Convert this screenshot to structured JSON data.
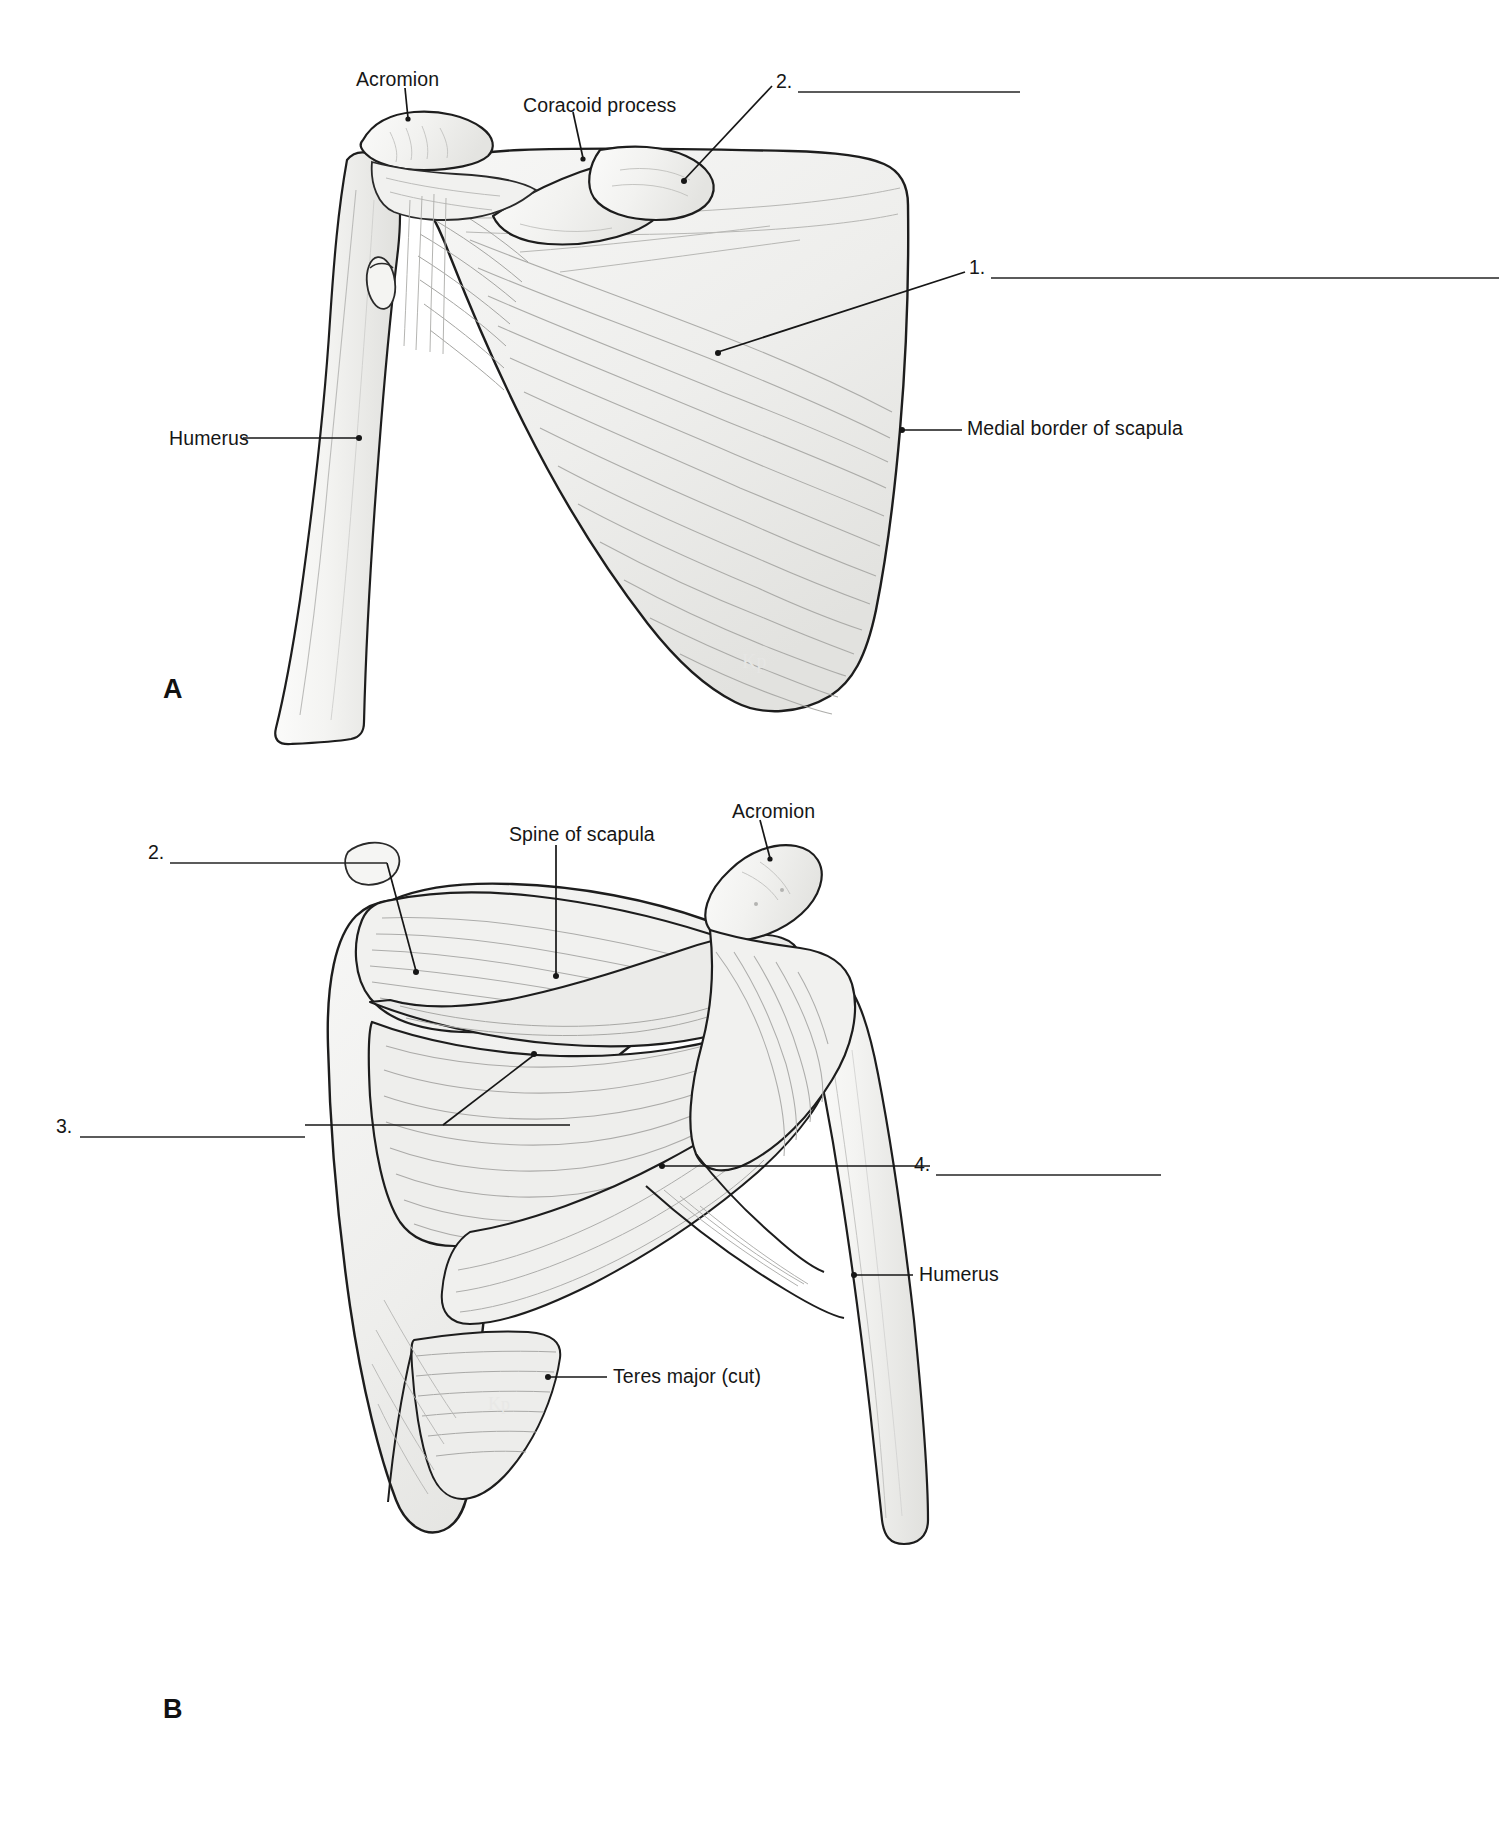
{
  "document": {
    "type": "anatomy-labeling-worksheet",
    "subject": "Muscles of the scapula and shoulder",
    "background_color": "#ffffff",
    "ink_color": "#161616"
  },
  "panels": [
    {
      "letter": "A",
      "view": "anterior",
      "letter_x": 163,
      "letter_y": 676,
      "labels": [
        {
          "text": "Acromion",
          "x": 356,
          "y": 70,
          "leader": "diagonal-down-right"
        },
        {
          "text": "Coracoid process",
          "x": 523,
          "y": 96,
          "leader": "diagonal-down-right"
        },
        {
          "text": "Humerus",
          "x": 169,
          "y": 429,
          "leader": "horizontal-right"
        },
        {
          "text": "Medial border of scapula",
          "x": 967,
          "y": 419,
          "leader": "horizontal-left"
        }
      ],
      "blanks": [
        {
          "number": "1.",
          "num_x": 969,
          "num_y": 258,
          "line_x": 991,
          "line_y": 278,
          "line_width": 508,
          "leader": "diagonal-down-left"
        },
        {
          "number": "2.",
          "num_x": 776,
          "num_y": 72,
          "line_x": 798,
          "line_y": 92,
          "line_width": 222,
          "leader": "diagonal-down-left"
        }
      ]
    },
    {
      "letter": "B",
      "view": "posterior",
      "letter_x": 163,
      "letter_y": 1696,
      "labels": [
        {
          "text": "Spine of scapula",
          "x": 509,
          "y": 825,
          "leader": "vertical-down"
        },
        {
          "text": "Acromion",
          "x": 732,
          "y": 802,
          "leader": "diagonal-down-right"
        },
        {
          "text": "Humerus",
          "x": 919,
          "y": 1265,
          "leader": "horizontal-left"
        },
        {
          "text": "Teres major (cut)",
          "x": 613,
          "y": 1367,
          "leader": "horizontal-left"
        }
      ],
      "blanks": [
        {
          "number": "2.",
          "num_x": 148,
          "num_y": 843,
          "line_x": 170,
          "line_y": 863,
          "line_width": 217,
          "leader": "diagonal-down-right"
        },
        {
          "number": "3.",
          "num_x": 56,
          "num_y": 1117,
          "line_x": 80,
          "line_y": 1137,
          "line_width": 225,
          "leader": "horizontal-right"
        },
        {
          "number": "4.",
          "num_x": 914,
          "num_y": 1155,
          "line_x": 936,
          "line_y": 1175,
          "line_width": 225,
          "leader": "horizontal-left"
        }
      ]
    }
  ],
  "colors": {
    "line": "#1a1a1a",
    "blank_line": "#2a2a2a",
    "bone_fill": "#f3f3f1",
    "bone_stroke": "#1d1d1d",
    "muscle_fill": "#efefed",
    "shade": "#d8d8d6"
  }
}
